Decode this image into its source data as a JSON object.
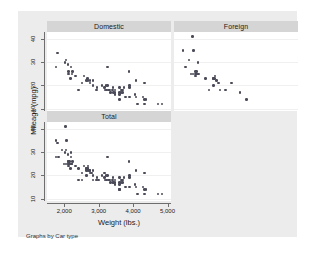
{
  "figure": {
    "note": "Graphs by Car type",
    "xlabel": "Weight (lbs.)",
    "ylabel": "Mileage (mpg)",
    "background_color": "#ececec",
    "panel_header_color": "#d5d5d5",
    "marker_color": "#4a4a58",
    "axis_color": "#6e6e6e"
  },
  "chart_data": {
    "type": "scatter",
    "title": "",
    "xlabel": "Weight (lbs.)",
    "ylabel": "Mileage (mpg)",
    "xlim": [
      1500,
      5100
    ],
    "ylim": [
      9,
      43
    ],
    "xticks": [
      2000,
      3000,
      4000,
      5000
    ],
    "xticklabels": [
      "2,000",
      "3,000",
      "4,000",
      "5,000"
    ],
    "yticks": [
      10,
      20,
      30,
      40
    ],
    "yticklabels": [
      "10",
      "20",
      "30",
      "40"
    ],
    "grid": true,
    "legend": "none",
    "note": "Graphs by Car type",
    "panels": [
      {
        "name": "Domestic",
        "row": 0,
        "col": 0,
        "points": [
          [
            4080,
            22
          ],
          [
            3350,
            17
          ],
          [
            2640,
            22
          ],
          [
            3250,
            20
          ],
          [
            4080,
            15
          ],
          [
            3670,
            18
          ],
          [
            3880,
            26
          ],
          [
            4330,
            21
          ],
          [
            3900,
            20
          ],
          [
            4290,
            15
          ],
          [
            4370,
            14
          ],
          [
            2110,
            29
          ],
          [
            2200,
            28
          ],
          [
            2690,
            22
          ],
          [
            3180,
            18
          ],
          [
            3220,
            18
          ],
          [
            4060,
            16
          ],
          [
            3600,
            17
          ],
          [
            3600,
            19
          ],
          [
            3740,
            19
          ],
          [
            3470,
            18
          ],
          [
            3600,
            14
          ],
          [
            3650,
            17
          ],
          [
            3690,
            18
          ],
          [
            3420,
            19
          ],
          [
            4130,
            12
          ],
          [
            4330,
            12
          ],
          [
            2230,
            25
          ],
          [
            2750,
            21
          ],
          [
            2950,
            19
          ],
          [
            3310,
            18
          ],
          [
            1800,
            34
          ],
          [
            2050,
            31
          ],
          [
            2120,
            26
          ],
          [
            2320,
            24
          ],
          [
            2580,
            24
          ],
          [
            2520,
            21
          ],
          [
            3100,
            20
          ],
          [
            3260,
            28
          ],
          [
            3410,
            18
          ],
          [
            3280,
            18
          ],
          [
            2830,
            22
          ],
          [
            3210,
            20
          ],
          [
            3430,
            17
          ],
          [
            3600,
            16
          ],
          [
            4330,
            14
          ],
          [
            4720,
            12
          ],
          [
            4840,
            12
          ],
          [
            1760,
            28
          ],
          [
            2020,
            30
          ],
          [
            2130,
            25
          ],
          [
            2190,
            23
          ],
          [
            2410,
            18
          ],
          [
            2670,
            23
          ],
          [
            2750,
            22
          ],
          [
            2930,
            18
          ],
          [
            3170,
            19
          ],
          [
            3470,
            17
          ],
          [
            3690,
            17
          ],
          [
            3900,
            19
          ],
          [
            2830,
            20
          ],
          [
            2240,
            26
          ],
          [
            3470,
            16
          ],
          [
            3780,
            15
          ],
          [
            3900,
            15
          ]
        ]
      },
      {
        "name": "Foreign",
        "row": 0,
        "col": 1,
        "points": [
          [
            2800,
            21
          ],
          [
            2640,
            23
          ],
          [
            2130,
            25
          ],
          [
            1760,
            35
          ],
          [
            2690,
            24
          ],
          [
            2160,
            25
          ],
          [
            2670,
            23
          ],
          [
            1830,
            28
          ],
          [
            2070,
            35
          ],
          [
            2210,
            25
          ],
          [
            2200,
            30
          ],
          [
            2520,
            18
          ],
          [
            2200,
            25
          ],
          [
            2120,
            26
          ],
          [
            2650,
            23
          ],
          [
            3170,
            21
          ],
          [
            2160,
            26
          ],
          [
            2120,
            24
          ],
          [
            2830,
            18
          ],
          [
            2650,
            20
          ],
          [
            2990,
            18
          ],
          [
            3420,
            17
          ],
          [
            3600,
            14
          ],
          [
            1930,
            31
          ],
          [
            2040,
            41
          ],
          [
            2050,
            25
          ],
          [
            1990,
            25
          ],
          [
            2410,
            23
          ],
          [
            2730,
            22
          ]
        ]
      },
      {
        "name": "Total",
        "row": 1,
        "col": 0,
        "points": [
          [
            4080,
            22
          ],
          [
            3350,
            17
          ],
          [
            2640,
            22
          ],
          [
            3250,
            20
          ],
          [
            4080,
            15
          ],
          [
            3670,
            18
          ],
          [
            3880,
            26
          ],
          [
            4330,
            21
          ],
          [
            3900,
            20
          ],
          [
            4290,
            15
          ],
          [
            4370,
            14
          ],
          [
            2110,
            29
          ],
          [
            2200,
            28
          ],
          [
            2690,
            22
          ],
          [
            3180,
            18
          ],
          [
            3220,
            18
          ],
          [
            4060,
            16
          ],
          [
            3600,
            17
          ],
          [
            3600,
            19
          ],
          [
            3740,
            19
          ],
          [
            3470,
            18
          ],
          [
            3600,
            14
          ],
          [
            3650,
            17
          ],
          [
            3690,
            18
          ],
          [
            3420,
            19
          ],
          [
            4130,
            12
          ],
          [
            4330,
            12
          ],
          [
            2230,
            25
          ],
          [
            2750,
            21
          ],
          [
            2950,
            19
          ],
          [
            3310,
            18
          ],
          [
            1800,
            34
          ],
          [
            2050,
            31
          ],
          [
            2120,
            26
          ],
          [
            2320,
            24
          ],
          [
            2580,
            24
          ],
          [
            2520,
            21
          ],
          [
            3100,
            20
          ],
          [
            3260,
            28
          ],
          [
            3410,
            18
          ],
          [
            3280,
            18
          ],
          [
            2830,
            22
          ],
          [
            3210,
            20
          ],
          [
            3430,
            17
          ],
          [
            3600,
            16
          ],
          [
            4330,
            14
          ],
          [
            4720,
            12
          ],
          [
            4840,
            12
          ],
          [
            1760,
            28
          ],
          [
            2020,
            30
          ],
          [
            2130,
            25
          ],
          [
            2190,
            23
          ],
          [
            2410,
            18
          ],
          [
            2670,
            23
          ],
          [
            2750,
            22
          ],
          [
            2930,
            18
          ],
          [
            3170,
            19
          ],
          [
            3470,
            17
          ],
          [
            3690,
            17
          ],
          [
            3900,
            19
          ],
          [
            2830,
            20
          ],
          [
            2240,
            26
          ],
          [
            3470,
            16
          ],
          [
            3780,
            15
          ],
          [
            3900,
            15
          ],
          [
            2800,
            21
          ],
          [
            2640,
            23
          ],
          [
            2130,
            25
          ],
          [
            1760,
            35
          ],
          [
            2690,
            24
          ],
          [
            2160,
            25
          ],
          [
            2670,
            23
          ],
          [
            1830,
            28
          ],
          [
            2070,
            35
          ],
          [
            2210,
            25
          ],
          [
            2200,
            30
          ],
          [
            2520,
            18
          ],
          [
            2200,
            25
          ],
          [
            2120,
            26
          ],
          [
            2650,
            23
          ],
          [
            3170,
            21
          ],
          [
            2160,
            26
          ],
          [
            2120,
            24
          ],
          [
            2830,
            18
          ],
          [
            2650,
            20
          ],
          [
            2990,
            18
          ],
          [
            3420,
            17
          ],
          [
            3600,
            14
          ],
          [
            1930,
            31
          ],
          [
            2040,
            41
          ],
          [
            2050,
            25
          ],
          [
            1990,
            25
          ],
          [
            2410,
            23
          ],
          [
            2730,
            22
          ]
        ]
      }
    ]
  }
}
